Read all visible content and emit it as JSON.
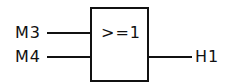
{
  "diagram": {
    "type": "logic-gate-or",
    "gate": {
      "label": ">=1"
    },
    "inputs": [
      {
        "label": "M3"
      },
      {
        "label": "M4"
      }
    ],
    "output": {
      "label": "H1"
    },
    "colors": {
      "stroke": "#111111",
      "background": "#ffffff"
    }
  }
}
